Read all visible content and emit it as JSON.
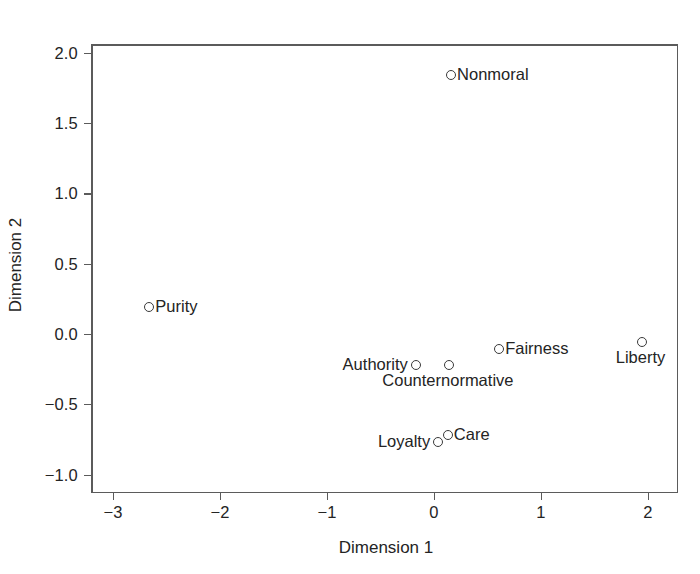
{
  "chart_data": {
    "type": "scatter",
    "title": "",
    "xlabel": "Dimension 1",
    "ylabel": "Dimension 2",
    "xlim": [
      -3.2,
      2.28
    ],
    "ylim": [
      -1.26,
      2.12
    ],
    "grid": false,
    "legend": "none",
    "xticks": [
      "−3",
      "−2",
      "−1",
      "0",
      "1",
      "2"
    ],
    "xtick_values": [
      -3,
      -2,
      -1,
      0,
      1,
      2
    ],
    "yticks": [
      "2.0",
      "1.5",
      "1.0",
      "0.5",
      "0.0",
      "−0.5",
      "−1.0"
    ],
    "ytick_values": [
      2.0,
      1.5,
      1.0,
      0.5,
      0.0,
      -0.5,
      -1.0
    ],
    "marker_style": "open-circle",
    "points": [
      {
        "label": "Nonmoral",
        "x": 0.15,
        "y": 1.85,
        "label_pos": "right"
      },
      {
        "label": "Purity",
        "x": -2.67,
        "y": 0.2,
        "label_pos": "right"
      },
      {
        "label": "Authority",
        "x": -0.18,
        "y": -0.21,
        "label_pos": "left"
      },
      {
        "label": "Counternormative",
        "x": 0.13,
        "y": -0.21,
        "label_pos": "below"
      },
      {
        "label": "Fairness",
        "x": 0.6,
        "y": -0.1,
        "label_pos": "right"
      },
      {
        "label": "Liberty",
        "x": 1.93,
        "y": -0.05,
        "label_pos": "below"
      },
      {
        "label": "Care",
        "x": 0.12,
        "y": -0.71,
        "label_pos": "right"
      },
      {
        "label": "Loyalty",
        "x": 0.03,
        "y": -0.76,
        "label_pos": "left"
      }
    ]
  },
  "colors": {
    "frame": "#5b5b5b",
    "marker_stroke": "#3a3a3a",
    "text": "#242424",
    "background": "#ffffff"
  }
}
